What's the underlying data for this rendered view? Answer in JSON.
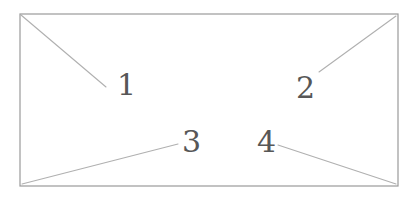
{
  "figure": {
    "background_color": "#ffffff",
    "frame": {
      "name": "rectangle-outline",
      "x": 20,
      "y": 14,
      "width": 378,
      "height": 172,
      "stroke_color": "#9a9a9a",
      "stroke_width": 1.2,
      "fill": "none"
    },
    "leader_line_color": "#b0b0b0",
    "leader_line_width": 1.1,
    "label_color": "#575757",
    "label_font_size": 30,
    "callouts": [
      {
        "id": "callout-1",
        "label": "1",
        "label_x": 117,
        "label_baseline_y": 95,
        "anchor_corner": "top-left",
        "line_start_x": 21,
        "line_start_y": 15,
        "line_end_x": 106,
        "line_end_y": 87
      },
      {
        "id": "callout-2",
        "label": "2",
        "label_x": 296,
        "label_baseline_y": 98,
        "anchor_corner": "top-right",
        "line_start_x": 396,
        "line_start_y": 16,
        "line_end_x": 319,
        "line_end_y": 72
      },
      {
        "id": "callout-3",
        "label": "3",
        "label_x": 182,
        "label_baseline_y": 152,
        "anchor_corner": "bottom-left",
        "line_start_x": 22,
        "line_start_y": 184,
        "line_end_x": 178,
        "line_end_y": 144
      },
      {
        "id": "callout-4",
        "label": "4",
        "label_x": 257,
        "label_baseline_y": 152,
        "anchor_corner": "bottom-right",
        "line_start_x": 278,
        "line_start_y": 145,
        "line_end_x": 396,
        "line_end_y": 184
      }
    ]
  }
}
